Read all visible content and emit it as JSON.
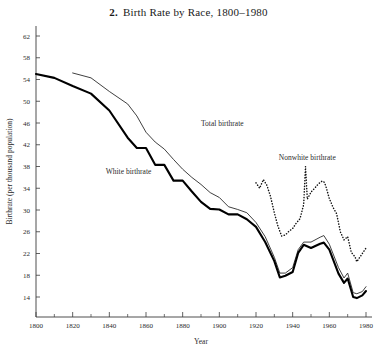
{
  "chart_data": {
    "type": "line",
    "title": "Birth Rate by Race, 1800–1980",
    "title_number": "2.",
    "xlabel": "Year",
    "ylabel": "Birthrate (per thousand population)",
    "xlim": [
      1800,
      1980
    ],
    "ylim": [
      10,
      64
    ],
    "grid": false,
    "legend_position": "inline-annotations",
    "y_ticks": [
      14,
      18,
      22,
      26,
      30,
      34,
      38,
      42,
      46,
      50,
      54,
      58,
      62
    ],
    "x_ticks": [
      1800,
      1820,
      1840,
      1860,
      1880,
      1900,
      1920,
      1940,
      1960,
      1980
    ],
    "x_minor_ticks": [
      1810,
      1830,
      1850,
      1870,
      1890,
      1910,
      1930,
      1950,
      1970
    ],
    "series": [
      {
        "name": "Total birthrate",
        "style": "thin-solid",
        "label_x": 1890,
        "label_y": 45.5,
        "x": [
          1820,
          1830,
          1840,
          1850,
          1855,
          1860,
          1865,
          1870,
          1875,
          1880,
          1885,
          1890,
          1895,
          1900,
          1905,
          1910,
          1915,
          1920,
          1925,
          1930,
          1933,
          1936,
          1940,
          1943,
          1946,
          1950,
          1955,
          1957,
          1960,
          1965,
          1968,
          1970,
          1973,
          1975,
          1978,
          1980
        ],
        "values": [
          55.2,
          54.3,
          51.8,
          49.5,
          47.3,
          44.3,
          42.5,
          41.2,
          39.3,
          37.5,
          36.0,
          34.7,
          33.2,
          32.3,
          30.6,
          30.1,
          29.5,
          27.7,
          25.1,
          21.3,
          18.4,
          18.4,
          19.4,
          22.7,
          24.1,
          24.1,
          25.0,
          25.3,
          23.7,
          19.4,
          17.5,
          18.4,
          14.8,
          14.6,
          15.0,
          15.9
        ]
      },
      {
        "name": "White birthrate",
        "style": "thick-solid",
        "label_x": 1838,
        "label_y": 36.6,
        "x": [
          1800,
          1810,
          1820,
          1830,
          1840,
          1850,
          1855,
          1860,
          1865,
          1870,
          1875,
          1880,
          1885,
          1890,
          1895,
          1900,
          1905,
          1910,
          1915,
          1920,
          1925,
          1930,
          1933,
          1936,
          1940,
          1943,
          1946,
          1950,
          1955,
          1957,
          1960,
          1965,
          1968,
          1970,
          1973,
          1975,
          1978,
          1980
        ],
        "values": [
          55.0,
          54.3,
          52.8,
          51.4,
          48.3,
          43.3,
          41.4,
          41.4,
          38.3,
          38.3,
          35.4,
          35.4,
          33.4,
          31.5,
          30.2,
          30.1,
          29.2,
          29.2,
          28.3,
          26.9,
          24.1,
          20.6,
          17.6,
          17.9,
          18.6,
          22.1,
          23.6,
          23.0,
          23.8,
          24.0,
          22.7,
          18.3,
          16.6,
          17.4,
          14.0,
          13.8,
          14.3,
          15.1
        ]
      },
      {
        "name": "Nonwhite birthrate",
        "style": "dotted",
        "label_x": 1948,
        "label_y": 39.2,
        "x": [
          1920,
          1922,
          1924,
          1926,
          1928,
          1930,
          1932,
          1934,
          1936,
          1938,
          1940,
          1942,
          1944,
          1946,
          1947,
          1948,
          1950,
          1952,
          1954,
          1956,
          1957,
          1958,
          1960,
          1962,
          1964,
          1966,
          1968,
          1970,
          1972,
          1974,
          1975,
          1976,
          1978,
          1980
        ],
        "values": [
          35.0,
          34.0,
          35.6,
          34.5,
          32.4,
          29.5,
          27.0,
          25.2,
          25.4,
          26.1,
          26.6,
          27.6,
          28.4,
          31.0,
          38.0,
          32.0,
          33.3,
          34.0,
          34.8,
          35.3,
          35.2,
          34.5,
          32.1,
          30.5,
          29.3,
          26.0,
          24.5,
          25.1,
          22.2,
          21.4,
          20.5,
          21.0,
          22.0,
          23.0
        ]
      }
    ]
  },
  "annotations": {
    "total_label": "Total birthrate",
    "white_label": "White birthrate",
    "nonwhite_label": "Nonwhite birthrate"
  }
}
